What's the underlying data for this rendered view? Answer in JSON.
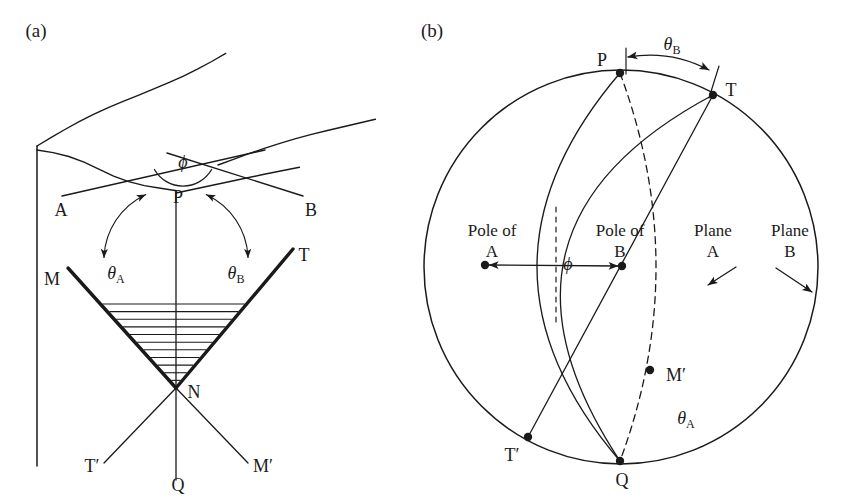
{
  "figure": {
    "background": "#ffffff",
    "stroke": "#1a1a1a",
    "width": 847,
    "height": 502
  },
  "panels": [
    {
      "id": "a",
      "label": "(a)",
      "label_pos": [
        36,
        33
      ],
      "description": "Block diagram of a fault/shear zone with wavy ground surface, planes A and B intersecting at P, conjugate wedge M-N-T with hatching, and lines T'-N-M' below with vertical axis P-N-Q."
    },
    {
      "id": "b",
      "label": "(b)",
      "label_pos": [
        432,
        33
      ],
      "description": "Stereographic projection (lower-hemisphere) showing poles of planes A and B separated by angle phi, great circles for Plane A and Plane B, and points P, T, T', Q, M'."
    }
  ],
  "panel_a": {
    "vertical_edge": {
      "x": 37,
      "y1": 146,
      "y2": 466
    },
    "ground_quad": [
      [
        37,
        146
      ],
      [
        181,
        171
      ],
      [
        264,
        186
      ],
      [
        181,
        171
      ]
    ],
    "surface_lines": [
      {
        "name": "line-A",
        "x1": 62,
        "y1": 196,
        "x2": 265,
        "y2": 150
      },
      {
        "name": "line-B",
        "x1": 167,
        "y1": 153,
        "x2": 303,
        "y2": 196
      }
    ],
    "wavy_edges": [
      {
        "name": "wavy-top-ridge",
        "x1": 37,
        "y1": 146,
        "x2": 225,
        "y2": 52
      },
      {
        "name": "wavy-right-ridge",
        "x1": 218,
        "y1": 165,
        "x2": 375,
        "y2": 118
      },
      {
        "name": "wavy-front-left",
        "x1": 37,
        "y1": 150,
        "x2": 176,
        "y2": 193
      },
      {
        "name": "wavy-front-right",
        "x1": 176,
        "y1": 193,
        "x2": 300,
        "y2": 170
      }
    ],
    "phi_arc": {
      "label": "ϕ",
      "label_pos": [
        183,
        169
      ],
      "cx": 183,
      "cy": 153,
      "r": 33
    },
    "apex": {
      "x": 176,
      "y": 192,
      "name": "P"
    },
    "axis": {
      "x": 176,
      "y1": 192,
      "y2": 480,
      "name": "PNQ-axis"
    },
    "wedge": {
      "vertex": [
        176,
        388
      ],
      "left_tip": [
        68,
        268
      ],
      "right_tip": [
        293,
        249
      ],
      "hatch_top_y": 304,
      "hatch_count": 11
    },
    "lower_lines": [
      {
        "name": "line-NT-prime",
        "x1": 176,
        "y1": 388,
        "x2": 104,
        "y2": 463
      },
      {
        "name": "line-NM-prime",
        "x1": 176,
        "y1": 388,
        "x2": 248,
        "y2": 463
      }
    ],
    "theta_a": {
      "label": "θ",
      "sub": "A",
      "label_pos": [
        116,
        275
      ],
      "arc": {
        "cx": 176,
        "cy": 260,
        "r": 72,
        "a1": 182,
        "a2": 245
      }
    },
    "theta_b": {
      "label": "θ",
      "sub": "B",
      "label_pos": [
        236,
        275
      ],
      "arc": {
        "cx": 176,
        "cy": 260,
        "r": 72,
        "a1": -2,
        "a2": -65
      }
    },
    "point_labels": [
      {
        "name": "label-A",
        "text": "A",
        "x": 61,
        "y": 212,
        "anchor": "middle"
      },
      {
        "name": "label-B",
        "text": "B",
        "x": 311,
        "y": 212,
        "anchor": "middle"
      },
      {
        "name": "label-P",
        "text": "P",
        "x": 178,
        "y": 199,
        "anchor": "middle"
      },
      {
        "name": "label-M",
        "text": "M",
        "x": 52,
        "y": 281,
        "anchor": "middle"
      },
      {
        "name": "label-T",
        "text": "T",
        "x": 304,
        "y": 257,
        "anchor": "middle"
      },
      {
        "name": "label-N",
        "text": "N",
        "x": 194,
        "y": 394,
        "anchor": "middle"
      },
      {
        "name": "label-T-prime",
        "text": "T′",
        "x": 92,
        "y": 468,
        "anchor": "middle"
      },
      {
        "name": "label-M-prime",
        "text": "M′",
        "x": 263,
        "y": 468,
        "anchor": "middle"
      },
      {
        "name": "label-Q",
        "text": "Q",
        "x": 178,
        "y": 487,
        "anchor": "middle"
      }
    ]
  },
  "panel_b": {
    "primitive_circle": {
      "cx": 621,
      "cy": 267,
      "r": 197
    },
    "points": [
      {
        "name": "point-P",
        "label": "P",
        "x": 620,
        "y": 73,
        "lx": 602,
        "ly": 62
      },
      {
        "name": "point-T",
        "label": "T",
        "x": 713,
        "y": 95,
        "lx": 731,
        "ly": 92
      },
      {
        "name": "point-T-prime",
        "label": "T′",
        "x": 528,
        "y": 437,
        "lx": 512,
        "ly": 457
      },
      {
        "name": "point-Q",
        "label": "Q",
        "x": 620,
        "y": 461,
        "lx": 622,
        "ly": 482
      },
      {
        "name": "point-M-prime",
        "label": "M′",
        "x": 650,
        "y": 370,
        "lx": 676,
        "ly": 377
      },
      {
        "name": "pole-of-A-dot",
        "label": "",
        "x": 485,
        "y": 265,
        "lx": 0,
        "ly": 0
      },
      {
        "name": "pole-of-B-dot",
        "label": "",
        "x": 622,
        "y": 266,
        "lx": 0,
        "ly": 0
      }
    ],
    "great_circles": [
      {
        "name": "plane-A-great-circle",
        "start": [
          620,
          73
        ],
        "end": [
          620,
          461
        ],
        "bulge": 83,
        "dashed": false
      },
      {
        "name": "plane-B-great-circle",
        "start": [
          713,
          95
        ],
        "end": [
          528,
          437
        ],
        "bulge": 0,
        "dashed": false
      },
      {
        "name": "plane-B-outer-arc",
        "start": [
          713,
          95
        ],
        "end": [
          620,
          461
        ],
        "bulge": 104,
        "dashed": false
      },
      {
        "name": "plane-A-inner-arc",
        "start": [
          620,
          73
        ],
        "end": [
          620,
          461
        ],
        "bulge": -36,
        "dashed": true
      }
    ],
    "phi_arrow": {
      "label": "ϕ",
      "label_pos": [
        568,
        266
      ],
      "left_end": [
        489,
        265
      ],
      "right_end": [
        618,
        266
      ],
      "dashed_x": 556
    },
    "theta_b_arrow": {
      "label": "θ",
      "sub": "B",
      "label_pos": [
        672,
        46
      ],
      "left_end": [
        628,
        57
      ],
      "right_end": [
        709,
        70
      ]
    },
    "theta_a_label": {
      "label": "θ",
      "sub": "A",
      "label_pos": [
        686,
        420
      ]
    },
    "text_labels": [
      {
        "name": "label-pole-of-A",
        "line1": "Pole of",
        "line2": "A",
        "x": 492,
        "y1": 232,
        "y2": 253
      },
      {
        "name": "label-pole-of-B",
        "line1": "Pole of",
        "line2": "B",
        "x": 620,
        "y1": 232,
        "y2": 253
      },
      {
        "name": "label-plane-A",
        "line1": "Plane",
        "line2": "A",
        "x": 713,
        "y1": 232,
        "y2": 253
      },
      {
        "name": "label-plane-B",
        "line1": "Plane",
        "line2": "B",
        "x": 790,
        "y1": 232,
        "y2": 253
      }
    ],
    "leader_arrows": [
      {
        "name": "plane-A-leader",
        "x1": 736,
        "y1": 267,
        "x2": 708,
        "y2": 285
      },
      {
        "name": "plane-B-leader",
        "x1": 776,
        "y1": 268,
        "x2": 812,
        "y2": 292
      }
    ]
  }
}
